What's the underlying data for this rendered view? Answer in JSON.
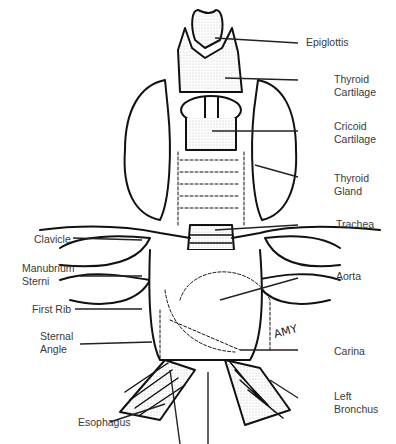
{
  "diagram": {
    "signature": "AMY",
    "labels_right": [
      {
        "id": "epiglottis",
        "lines": [
          "Epiglottis"
        ]
      },
      {
        "id": "thyroid-cartilage",
        "lines": [
          "Thyroid",
          "Cartilage"
        ]
      },
      {
        "id": "cricoid-cartilage",
        "lines": [
          "Cricoid",
          "Cartilage"
        ]
      },
      {
        "id": "thyroid-gland",
        "lines": [
          "Thyroid",
          "Gland"
        ]
      },
      {
        "id": "trachea",
        "lines": [
          "Trachea"
        ]
      },
      {
        "id": "aorta",
        "lines": [
          "Aorta"
        ]
      },
      {
        "id": "carina",
        "lines": [
          "Carina"
        ]
      },
      {
        "id": "left-bronchus",
        "lines": [
          "Left",
          "Bronchus"
        ]
      }
    ],
    "labels_left": [
      {
        "id": "clavicle",
        "lines": [
          "Clavicle"
        ]
      },
      {
        "id": "manubrium-sterni",
        "lines": [
          "Manubrium",
          "Sterni"
        ]
      },
      {
        "id": "first-rib",
        "lines": [
          "First Rib"
        ]
      },
      {
        "id": "sternal-angle",
        "lines": [
          "Sternal",
          "Angle"
        ]
      },
      {
        "id": "esophagus",
        "lines": [
          "Esophagus"
        ]
      }
    ]
  }
}
